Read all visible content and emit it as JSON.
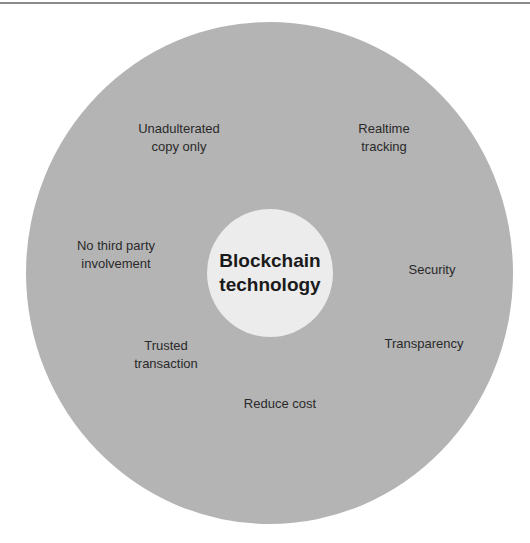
{
  "diagram": {
    "center": {
      "label": "Blockchain\ntechnology"
    },
    "benefits": [
      {
        "label": "Unadulterated\ncopy only",
        "x": 179,
        "y": 138
      },
      {
        "label": "Realtime\ntracking",
        "x": 384,
        "y": 138
      },
      {
        "label": "No third party\ninvolvement",
        "x": 116,
        "y": 255
      },
      {
        "label": "Security",
        "x": 432,
        "y": 270
      },
      {
        "label": "Trusted\ntransaction",
        "x": 166,
        "y": 355
      },
      {
        "label": "Transparency",
        "x": 424,
        "y": 344
      },
      {
        "label": "Reduce cost",
        "x": 280,
        "y": 404
      }
    ],
    "colors": {
      "outer": "#b4b4b4",
      "inner": "#ececec",
      "text": "#2a2a2a"
    }
  }
}
